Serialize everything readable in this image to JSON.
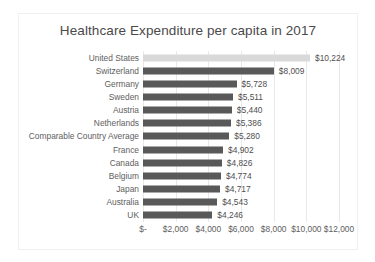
{
  "chart_data": {
    "type": "bar",
    "orientation": "horizontal",
    "title": "Healthcare Expenditure per capita in 2017",
    "xlabel": "",
    "ylabel": "",
    "xlim": [
      0,
      12000
    ],
    "grid": true,
    "legend": false,
    "categories": [
      "United States",
      "Switzerland",
      "Germany",
      "Sweden",
      "Austria",
      "Netherlands",
      "Comparable Country Average",
      "France",
      "Canada",
      "Belgium",
      "Japan",
      "Australia",
      "UK"
    ],
    "values": [
      10224,
      8009,
      5728,
      5511,
      5440,
      5386,
      5280,
      4902,
      4826,
      4774,
      4717,
      4543,
      4246
    ],
    "data_labels": [
      "$10,224",
      "$8,009",
      "$5,728",
      "$5,511",
      "$5,440",
      "$5,386",
      "$5,280",
      "$4,902",
      "$4,826",
      "$4,774",
      "$4,717",
      "$4,543",
      "$4,246"
    ],
    "highlight_index": 0,
    "bar_color": "#595959",
    "highlight_color": "#d9d9d9",
    "xticks": [
      0,
      2000,
      4000,
      6000,
      8000,
      10000,
      12000
    ],
    "xtick_labels": [
      "$-",
      "$2,000",
      "$4,000",
      "$6,000",
      "$8,000",
      "$10,000",
      "$12,000"
    ]
  }
}
